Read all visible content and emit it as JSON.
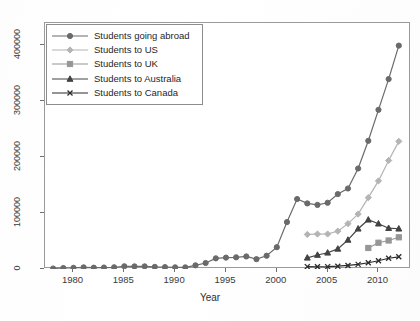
{
  "chart_data": {
    "type": "line",
    "title": "",
    "xlabel": "Year",
    "ylabel": "",
    "xlim": [
      1977.2,
      2013.2
    ],
    "ylim": [
      0,
      440000
    ],
    "grid": false,
    "legend_position": "upper left",
    "xticks": [
      "1980",
      "1985",
      "1990",
      "1995",
      "2000",
      "2005",
      "2010"
    ],
    "xtick_values": [
      1980,
      1985,
      1990,
      1995,
      2000,
      2005,
      2010
    ],
    "yticks": [
      "0",
      "100000",
      "200000",
      "300000",
      "400000"
    ],
    "ytick_values": [
      0,
      100000,
      200000,
      300000,
      400000
    ],
    "series": [
      {
        "name": "Students going abroad",
        "marker": "circle",
        "color": "#6a6a6a",
        "x": [
          1978,
          1979,
          1980,
          1981,
          1982,
          1983,
          1984,
          1985,
          1986,
          1987,
          1988,
          1989,
          1990,
          1991,
          1992,
          1993,
          1994,
          1995,
          1996,
          1997,
          1998,
          1999,
          2000,
          2001,
          2002,
          2003,
          2004,
          2005,
          2006,
          2007,
          2008,
          2009,
          2010,
          2011,
          2012
        ],
        "values": [
          860,
          1750,
          2124,
          2922,
          2326,
          2633,
          3073,
          4888,
          4676,
          4703,
          3786,
          3329,
          2950,
          2900,
          6540,
          10742,
          19071,
          20381,
          20905,
          22410,
          17622,
          23749,
          38989,
          83973,
          125179,
          117307,
          114682,
          118515,
          134000,
          144000,
          179800,
          229300,
          284700,
          339700,
          399600
        ]
      },
      {
        "name": "Students to US",
        "marker": "diamond",
        "color": "#b4b4b4",
        "x": [
          2003,
          2004,
          2005,
          2006,
          2007,
          2008,
          2009,
          2010,
          2011,
          2012
        ],
        "values": [
          61765,
          62523,
          62582,
          67723,
          81127,
          98235,
          127628,
          157558,
          194029,
          228300
        ]
      },
      {
        "name": "Students to UK",
        "marker": "square",
        "color": "#969696",
        "x": [
          2009,
          2010,
          2011,
          2012
        ],
        "values": [
          37600,
          47000,
          51000,
          56700
        ]
      },
      {
        "name": "Students to Australia",
        "marker": "triangle",
        "color": "#434343",
        "x": [
          2003,
          2004,
          2005,
          2006,
          2007,
          2008,
          2009,
          2010,
          2011,
          2012
        ],
        "values": [
          20000,
          25000,
          29000,
          36000,
          52000,
          72000,
          88000,
          81000,
          73000,
          72000
        ]
      },
      {
        "name": "Students to Canada",
        "marker": "x",
        "color": "#2b2b2b",
        "x": [
          2003,
          2004,
          2005,
          2006,
          2007,
          2008,
          2009,
          2010,
          2011,
          2012
        ],
        "values": [
          4300,
          4000,
          4200,
          5000,
          6400,
          8300,
          11200,
          14800,
          19200,
          21800
        ]
      }
    ]
  },
  "axis": {
    "xlabel": "Year"
  },
  "legend": {
    "items": [
      {
        "label": "Students going abroad"
      },
      {
        "label": "Students to US"
      },
      {
        "label": "Students to UK"
      },
      {
        "label": "Students to Australia"
      },
      {
        "label": "Students to Canada"
      }
    ]
  }
}
